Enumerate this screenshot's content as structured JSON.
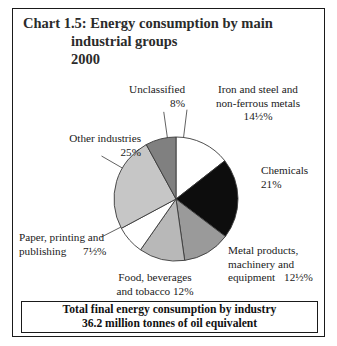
{
  "title": {
    "line1": "Chart 1.5: Energy consumption by main",
    "line2": "industrial groups",
    "line3": "2000"
  },
  "footer": {
    "line1": "Total final energy consumption by industry",
    "line2": "36.2 million tonnes of oil equivalent"
  },
  "labels": {
    "unclassified": {
      "l1": "Unclassified",
      "l2": "8%"
    },
    "iron": {
      "l1": "Iron and steel and",
      "l2": "non-ferrous metals",
      "l3": "14½%"
    },
    "chemicals": {
      "l1": "Chemicals",
      "l2": "21%"
    },
    "metal": {
      "l1": "Metal products,",
      "l2": "machinery and",
      "l3": "equipment",
      "l3b": "12½%"
    },
    "food": {
      "l1": "Food, beverages",
      "l2": "and tobacco  12%"
    },
    "paper": {
      "l1": "Paper, printing and",
      "l2": "publishing",
      "l2b": "7½%"
    },
    "other": {
      "l1": "Other industries",
      "l2": "25%"
    }
  },
  "colors": {
    "outline": "#3a3a3a",
    "white": "#ffffff",
    "black": "#0d0d0d",
    "grey_dark": "#808080",
    "grey_medium": "#9a9a9a",
    "grey_light": "#b8b8b8",
    "grey_pale": "#c6c6c6",
    "text": "#1a1a1a"
  },
  "chart_data": {
    "type": "pie",
    "title": "Chart 1.5: Energy consumption by main industrial groups 2000",
    "subtitle": "Total final energy consumption by industry 36.2 million tonnes of oil equivalent",
    "unit": "percent of total",
    "total_label": "36.2 million tonnes of oil equivalent",
    "legend": "none (external labels)",
    "start_angle_deg": 0,
    "direction": "clockwise",
    "labels": [
      "Iron and steel and non-ferrous metals",
      "Chemicals",
      "Metal products, machinery and equipment",
      "Food, beverages and tobacco",
      "Paper, printing and publishing",
      "Other industries",
      "Unclassified"
    ],
    "values": [
      14.5,
      21,
      12.5,
      12,
      7.5,
      25,
      8
    ],
    "value_labels": [
      "14½%",
      "21%",
      "12½%",
      "12%",
      "7½%",
      "25%",
      "8%"
    ],
    "slice_colors": [
      "#ffffff",
      "#0d0d0d",
      "#9a9a9a",
      "#b8b8b8",
      "#ffffff",
      "#c6c6c6",
      "#808080"
    ],
    "sum": 100
  }
}
